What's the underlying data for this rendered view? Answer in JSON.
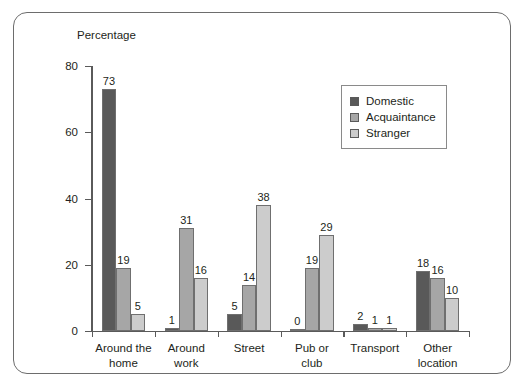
{
  "chart_data": {
    "type": "bar",
    "title": "",
    "ylabel": "Percentage",
    "xlabel": "",
    "ylim": [
      0,
      80
    ],
    "yticks": [
      0,
      20,
      40,
      60,
      80
    ],
    "grid": false,
    "legend_position": "upper-right-inside",
    "categories": [
      "Around the\nhome",
      "Around\nwork",
      "Street",
      "Pub or\nclub",
      "Transport",
      "Other\nlocation"
    ],
    "series": [
      {
        "name": "Domestic",
        "color": "#595959",
        "values": [
          73,
          1,
          5,
          0,
          2,
          18
        ]
      },
      {
        "name": "Acquaintance",
        "color": "#a6a6a6",
        "values": [
          19,
          31,
          14,
          19,
          1,
          16
        ]
      },
      {
        "name": "Stranger",
        "color": "#cccccc",
        "values": [
          5,
          16,
          38,
          29,
          1,
          10
        ]
      }
    ]
  },
  "frame": {
    "border_color": "#6d6d6d"
  },
  "axis": {
    "line_color": "#5a5a5a",
    "text_color": "#231f20"
  }
}
